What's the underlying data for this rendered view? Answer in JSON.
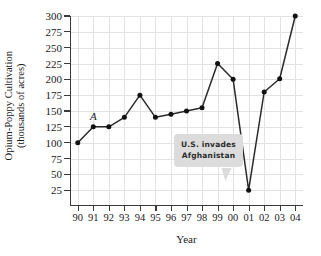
{
  "chart_data": {
    "type": "line",
    "title": "",
    "xlabel": "Year",
    "ylabel": "Opium-Poppy Cultivation (thousands of acres)",
    "ylabel_line1": "Opium-Poppy Cultivation",
    "ylabel_line2": "(thousands of acres)",
    "categories": [
      "90",
      "91",
      "92",
      "93",
      "94",
      "95",
      "96",
      "97",
      "98",
      "99",
      "00",
      "01",
      "02",
      "03",
      "04"
    ],
    "values": [
      100,
      125,
      125,
      140,
      175,
      140,
      145,
      150,
      155,
      225,
      200,
      25,
      180,
      201,
      300
    ],
    "ylim": [
      0,
      300
    ],
    "ytick_values": [
      25,
      50,
      75,
      100,
      125,
      150,
      175,
      200,
      225,
      250,
      275,
      300
    ],
    "ytick_labels": [
      "25",
      "50",
      "75",
      "100",
      "125",
      "150",
      "175",
      "200",
      "225",
      "250",
      "275",
      "300"
    ],
    "grid": true,
    "legend": "none",
    "series_color": "#2b2b2b",
    "grid_color": "#e2e2e2",
    "axis_color": "#3a3a3a",
    "annotations": [
      {
        "name": "point-label-a",
        "text": "A",
        "at_category": "91",
        "at_value": 125,
        "style": "italic"
      },
      {
        "name": "callout-us-invades-afghanistan",
        "line1": "U.S. invades",
        "line2": "Afghanistan",
        "points_to_category": "01",
        "points_to_value": 25,
        "background": "#dcdcdc"
      }
    ]
  }
}
